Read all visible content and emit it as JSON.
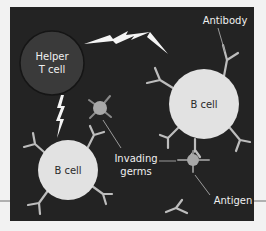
{
  "diagram": {
    "title": "",
    "colors": {
      "page_background": "#f2f2f2",
      "panel_background": "#232323",
      "helper_t_cell_fill": "#3a3a3a",
      "b_cell_fill": "#e2e2e2",
      "germ_fill": "#a8a8a8",
      "antibody_stroke": "#bdbdbd",
      "bolt_fill": "#f4f4f4",
      "label_light": "#f0f0f0",
      "label_dark": "#2a2a2a",
      "rule_line": "#9a9a9a"
    },
    "nodes": {
      "helper_t_cell": {
        "line1": "Helper",
        "line2": "T cell"
      },
      "b_cell_right": {
        "label": "B cell"
      },
      "b_cell_left": {
        "label": "B cell"
      }
    },
    "labels": {
      "antibody": "Antibody",
      "invading_germs_line1": "Invading",
      "invading_germs_line2": "germs",
      "antigen": "Antigen"
    },
    "edges": [
      {
        "from": "helper_t_cell",
        "to": "b_cell_right",
        "style": "lightning-bolt"
      },
      {
        "from": "helper_t_cell",
        "to": "b_cell_left",
        "style": "lightning-bolt"
      }
    ]
  }
}
